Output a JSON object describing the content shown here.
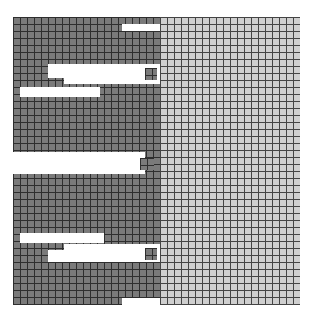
{
  "diagram": {
    "type": "mesh-grid",
    "colors": {
      "background": "#ffffff",
      "dark_fill": "#7a7a7a",
      "dark_lines": "#2e2e2e",
      "light_fill": "#cfcfcf",
      "light_lines": "#444444"
    },
    "cell_size_px": 7,
    "regions": [
      {
        "name": "dark-region",
        "x": 13,
        "y": 17,
        "w": 147,
        "h": 288,
        "color": "dark"
      },
      {
        "name": "light-region",
        "x": 160,
        "y": 17,
        "w": 140,
        "h": 288,
        "color": "light"
      }
    ],
    "gaps": [
      {
        "name": "top-right-notch",
        "x": 122,
        "y": 24,
        "w": 38,
        "h": 7
      },
      {
        "name": "slot-upper-1",
        "x": 48,
        "y": 64,
        "w": 100,
        "h": 14
      },
      {
        "name": "slot-upper-1-step",
        "x": 64,
        "y": 64,
        "w": 96,
        "h": 20
      },
      {
        "name": "slot-upper-2",
        "x": 20,
        "y": 87,
        "w": 80,
        "h": 10
      },
      {
        "name": "mid-slot",
        "x": 8,
        "y": 152,
        "w": 137,
        "h": 22
      },
      {
        "name": "slot-lower-1",
        "x": 20,
        "y": 233,
        "w": 84,
        "h": 10
      },
      {
        "name": "slot-lower-2",
        "x": 64,
        "y": 244,
        "w": 96,
        "h": 14
      },
      {
        "name": "slot-lower-2b",
        "x": 48,
        "y": 250,
        "w": 112,
        "h": 12
      },
      {
        "name": "bottom-right-notch",
        "x": 122,
        "y": 298,
        "w": 38,
        "h": 7
      },
      {
        "name": "right-top-notch",
        "x": 300,
        "y": 17,
        "w": 11,
        "h": 7
      },
      {
        "name": "light-top-left-edge",
        "x": 155,
        "y": 10,
        "w": 10,
        "h": 7
      }
    ],
    "islands": [
      {
        "name": "upper-island",
        "x": 145,
        "y": 68,
        "w": 12,
        "h": 12
      },
      {
        "name": "mid-island",
        "x": 140,
        "y": 158,
        "w": 14,
        "h": 12
      },
      {
        "name": "lower-island",
        "x": 145,
        "y": 248,
        "w": 12,
        "h": 12
      }
    ]
  }
}
